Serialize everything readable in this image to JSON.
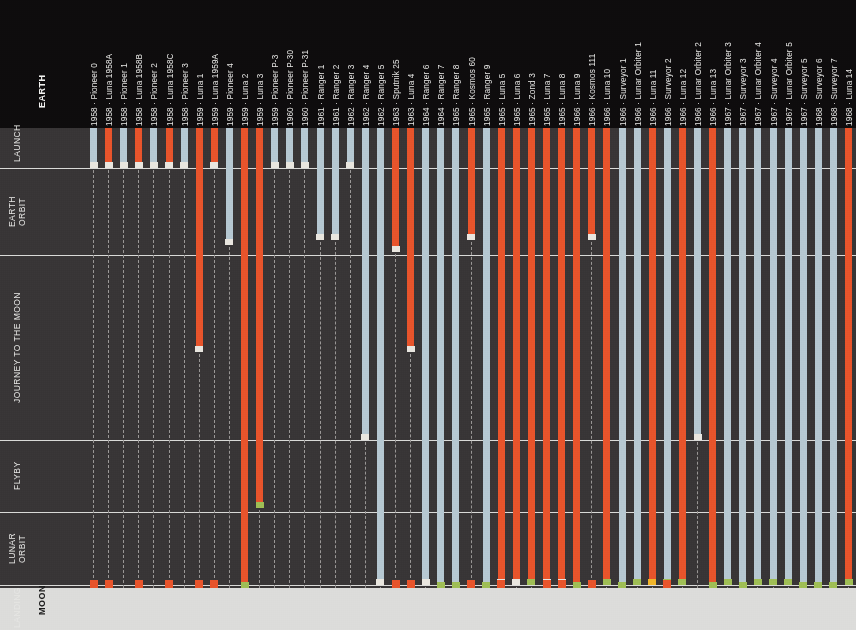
{
  "meta": {
    "width": 856,
    "height": 630
  },
  "colors": {
    "background_header": "#0e0c0d",
    "background_plot": "#383536",
    "moon_surface": "#dcdcda",
    "ussr_orange": "#e8542b",
    "usa_blue": "#b6c8d2",
    "cap_white": "#e9e6df",
    "cap_green": "#9fbe55",
    "cap_yellow": "#f0b429",
    "separator": "#e8e8e6",
    "dash": "#9a9796",
    "text_light": "#e6e6e4",
    "text_dark": "#1a1a1a"
  },
  "axis": {
    "endpoint_top": "EARTH",
    "endpoint_bottom": "MOON",
    "stages": [
      {
        "id": "launch",
        "label": "LAUNCH",
        "top": 118,
        "bottom": 168
      },
      {
        "id": "earth-orbit",
        "label": "EARTH\nORBIT",
        "top": 168,
        "bottom": 255
      },
      {
        "id": "journey",
        "label": "JOURNEY TO THE MOON",
        "top": 255,
        "bottom": 440
      },
      {
        "id": "flyby",
        "label": "FLYBY",
        "top": 440,
        "bottom": 512
      },
      {
        "id": "lunar-orbit",
        "label": "LUNAR\nORBIT",
        "top": 512,
        "bottom": 585
      },
      {
        "id": "landing",
        "label": "LANDING",
        "top": 585,
        "bottom": 630
      }
    ],
    "separator_y": [
      168,
      255,
      440,
      512,
      585
    ],
    "launch_top_y": 128,
    "moon_surface_y": 588
  },
  "legend": {
    "orange_meaning": "USSR mission",
    "blue_meaning": "USA mission",
    "green_cap_meaning": "objective achieved",
    "white_cap_meaning": "mission ended / failure",
    "orange_square_meaning": "crashed / lost"
  },
  "missions": [
    {
      "year": "1958",
      "name": "Pioneer 0",
      "label": "1958 · Pioneer 0",
      "color": "blue",
      "end": 168,
      "cap": "white",
      "crash": true
    },
    {
      "year": "1958",
      "name": "Luna 1958A",
      "label": "1958 · Luna 1958A",
      "color": "orange",
      "end": 168,
      "cap": "white",
      "crash": true
    },
    {
      "year": "1958",
      "name": "Pioneer 1",
      "label": "1958 · Pioneer 1",
      "color": "blue",
      "end": 168,
      "cap": "white",
      "crash": false
    },
    {
      "year": "1958",
      "name": "Luna 1958B",
      "label": "1958 · Luna 1958B",
      "color": "orange",
      "end": 168,
      "cap": "white",
      "crash": true
    },
    {
      "year": "1958",
      "name": "Pioneer 2",
      "label": "1958 · Pioneer 2",
      "color": "blue",
      "end": 168,
      "cap": "white",
      "crash": false
    },
    {
      "year": "1958",
      "name": "Luna 1958C",
      "label": "1958 · Luna 1958C",
      "color": "orange",
      "end": 168,
      "cap": "white",
      "crash": true
    },
    {
      "year": "1958",
      "name": "Pioneer 3",
      "label": "1958 · Pioneer 3",
      "color": "blue",
      "end": 168,
      "cap": "white",
      "crash": false
    },
    {
      "year": "1959",
      "name": "Luna 1",
      "label": "1959 · Luna 1",
      "color": "orange",
      "end": 352,
      "cap": "white",
      "crash": true
    },
    {
      "year": "1959",
      "name": "Luna 1959A",
      "label": "1959 · Luna 1959A",
      "color": "orange",
      "end": 168,
      "cap": "white",
      "crash": true
    },
    {
      "year": "1959",
      "name": "Pioneer 4",
      "label": "1959 · Pioneer 4",
      "color": "blue",
      "end": 245,
      "cap": "white",
      "crash": false
    },
    {
      "year": "1959",
      "name": "Luna 2",
      "label": "1959 · Luna 2",
      "color": "orange",
      "end": 588,
      "cap": "green",
      "crash": false
    },
    {
      "year": "1959",
      "name": "Luna 3",
      "label": "1959 · Luna 3",
      "color": "orange",
      "end": 508,
      "cap": "green",
      "crash": false
    },
    {
      "year": "1959",
      "name": "Pioneer P-3",
      "label": "1959 · Pioneer P-3",
      "color": "blue",
      "end": 168,
      "cap": "white",
      "crash": false
    },
    {
      "year": "1960",
      "name": "Pioneer P-30",
      "label": "1960 · Pioneer P-30",
      "color": "blue",
      "end": 168,
      "cap": "white",
      "crash": false
    },
    {
      "year": "1960",
      "name": "Pioneer P-31",
      "label": "1960 · Pioneer P-31",
      "color": "blue",
      "end": 168,
      "cap": "white",
      "crash": false
    },
    {
      "year": "1961",
      "name": "Ranger 1",
      "label": "1961 · Ranger 1",
      "color": "blue",
      "end": 240,
      "cap": "white",
      "crash": false
    },
    {
      "year": "1961",
      "name": "Ranger 2",
      "label": "1961 · Ranger 2",
      "color": "blue",
      "end": 240,
      "cap": "white",
      "crash": false
    },
    {
      "year": "1962",
      "name": "Ranger 3",
      "label": "1962 · Ranger 3",
      "color": "blue",
      "end": 168,
      "cap": "white",
      "crash": false
    },
    {
      "year": "1962",
      "name": "Ranger 4",
      "label": "1962 · Ranger 4",
      "color": "blue",
      "end": 440,
      "cap": "white",
      "crash": false
    },
    {
      "year": "1962",
      "name": "Ranger 5",
      "label": "1962 · Ranger 5",
      "color": "blue",
      "end": 585,
      "cap": "white",
      "crash": false
    },
    {
      "year": "1963",
      "name": "Sputnik 25",
      "label": "1963 · Sputnik 25",
      "color": "orange",
      "end": 252,
      "cap": "white",
      "crash": true
    },
    {
      "year": "1963",
      "name": "Luna 4",
      "label": "1963 · Luna 4",
      "color": "orange",
      "end": 352,
      "cap": "white",
      "crash": true
    },
    {
      "year": "1964",
      "name": "Ranger 6",
      "label": "1964 · Ranger 6",
      "color": "blue",
      "end": 585,
      "cap": "white",
      "crash": false
    },
    {
      "year": "1964",
      "name": "Ranger 7",
      "label": "1964 · Ranger 7",
      "color": "blue",
      "end": 588,
      "cap": "green",
      "crash": false
    },
    {
      "year": "1965",
      "name": "Ranger 8",
      "label": "1965 · Ranger 8",
      "color": "blue",
      "end": 588,
      "cap": "green",
      "crash": false
    },
    {
      "year": "1965",
      "name": "Kosmos 60",
      "label": "1965 · Kosmos 60",
      "color": "orange",
      "end": 240,
      "cap": "white",
      "crash": true
    },
    {
      "year": "1965",
      "name": "Ranger 9",
      "label": "1965 · Ranger 9",
      "color": "blue",
      "end": 588,
      "cap": "green",
      "crash": false
    },
    {
      "year": "1965",
      "name": "Luna 5",
      "label": "1965 · Luna 5",
      "color": "orange",
      "end": 585,
      "cap": "white",
      "crash": true
    },
    {
      "year": "1965",
      "name": "Luna 6",
      "label": "1965 · Luna 6",
      "color": "orange",
      "end": 585,
      "cap": "white",
      "crash": false
    },
    {
      "year": "1965",
      "name": "Zond 3",
      "label": "1965 · Zond 3",
      "color": "orange",
      "end": 585,
      "cap": "green",
      "crash": false
    },
    {
      "year": "1965",
      "name": "Luna 7",
      "label": "1965 · Luna 7",
      "color": "orange",
      "end": 585,
      "cap": "white",
      "crash": true
    },
    {
      "year": "1965",
      "name": "Luna 8",
      "label": "1965 · Luna 8",
      "color": "orange",
      "end": 585,
      "cap": "white",
      "crash": true
    },
    {
      "year": "1966",
      "name": "Luna 9",
      "label": "1966 · Luna 9",
      "color": "orange",
      "end": 588,
      "cap": "green",
      "crash": false
    },
    {
      "year": "1966",
      "name": "Kosmos 111",
      "label": "1966 · Kosmos 111",
      "color": "orange",
      "end": 240,
      "cap": "white",
      "crash": true
    },
    {
      "year": "1966",
      "name": "Luna 10",
      "label": "1966 · Luna 10",
      "color": "orange",
      "end": 585,
      "cap": "green",
      "crash": false
    },
    {
      "year": "1966",
      "name": "Surveyor 1",
      "label": "1966 · Surveyor 1",
      "color": "blue",
      "end": 588,
      "cap": "green",
      "crash": false
    },
    {
      "year": "1966",
      "name": "Lunar Orbiter 1",
      "label": "1966 · Lunar Orbiter 1",
      "color": "blue",
      "end": 585,
      "cap": "green",
      "crash": false
    },
    {
      "year": "1966",
      "name": "Luna 11",
      "label": "1966 · Luna 11",
      "color": "orange",
      "end": 585,
      "cap": "yellow",
      "crash": false
    },
    {
      "year": "1966",
      "name": "Surveyor 2",
      "label": "1966 · Surveyor 2",
      "color": "blue",
      "end": 585,
      "cap": "green",
      "crash": true
    },
    {
      "year": "1966",
      "name": "Luna 12",
      "label": "1966 · Luna 12",
      "color": "orange",
      "end": 585,
      "cap": "green",
      "crash": false
    },
    {
      "year": "1966",
      "name": "Lunar Orbiter 2",
      "label": "1966 · Lunar Orbiter 2",
      "color": "blue",
      "end": 440,
      "cap": "white",
      "crash": false
    },
    {
      "year": "1966",
      "name": "Luna 13",
      "label": "1966 · Luna 13",
      "color": "orange",
      "end": 588,
      "cap": "green",
      "crash": false
    },
    {
      "year": "1967",
      "name": "Lunar Orbiter 3",
      "label": "1967 · Lunar Orbiter 3",
      "color": "blue",
      "end": 585,
      "cap": "green",
      "crash": false
    },
    {
      "year": "1967",
      "name": "Surveyor 3",
      "label": "1967 · Surveyor 3",
      "color": "blue",
      "end": 588,
      "cap": "green",
      "crash": false
    },
    {
      "year": "1967",
      "name": "Lunar Orbiter 4",
      "label": "1967 · Lunar Orbiter 4",
      "color": "blue",
      "end": 585,
      "cap": "green",
      "crash": false
    },
    {
      "year": "1967",
      "name": "Surveyor 4",
      "label": "1967 · Surveyor 4",
      "color": "blue",
      "end": 585,
      "cap": "green",
      "crash": false
    },
    {
      "year": "1967",
      "name": "Lunar Orbiter 5",
      "label": "1967 · Lunar Orbiter 5",
      "color": "blue",
      "end": 585,
      "cap": "green",
      "crash": false
    },
    {
      "year": "1967",
      "name": "Surveyor 5",
      "label": "1967 · Surveyor 5",
      "color": "blue",
      "end": 588,
      "cap": "green",
      "crash": false
    },
    {
      "year": "1968",
      "name": "Surveyor 6",
      "label": "1968 · Surveyor 6",
      "color": "blue",
      "end": 588,
      "cap": "green",
      "crash": false
    },
    {
      "year": "1968",
      "name": "Surveyor 7",
      "label": "1968 · Surveyor 7",
      "color": "blue",
      "end": 588,
      "cap": "green",
      "crash": false
    },
    {
      "year": "1968",
      "name": "Luna 14",
      "label": "1968 · Luna 14",
      "color": "orange",
      "end": 585,
      "cap": "green",
      "crash": false
    }
  ]
}
